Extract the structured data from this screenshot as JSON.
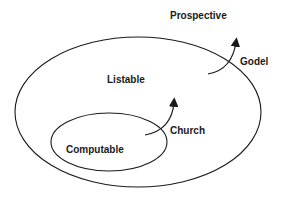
{
  "diagram": {
    "type": "nested-sets",
    "regions": [
      {
        "id": "prospective",
        "label": "Prospective"
      },
      {
        "id": "listable",
        "label": "Listable"
      },
      {
        "id": "computable",
        "label": "Computable"
      }
    ],
    "transitions": [
      {
        "id": "church",
        "label": "Church",
        "from": "Computable",
        "to": "Listable"
      },
      {
        "id": "godel",
        "label": "Godel",
        "from": "Listable",
        "to": "Prospective"
      }
    ],
    "colors": {
      "stroke": "#1a1a1a",
      "background": "#ffffff"
    }
  }
}
